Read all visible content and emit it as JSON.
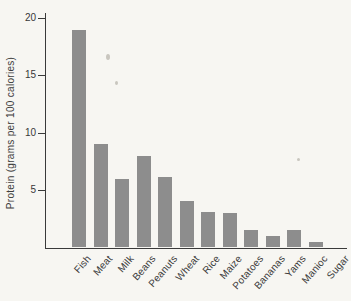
{
  "figure": {
    "background_color": "#f7f6f2",
    "bar_color": "#8d8d8d",
    "axis_color": "#3a3a3a",
    "text_color": "#3a3a3a"
  },
  "chart_data": {
    "type": "bar",
    "title": "",
    "xlabel": "",
    "ylabel": "Protein (grams per 100 calories)",
    "categories": [
      "Fish",
      "Meat",
      "Milk",
      "Beans",
      "Peanuts",
      "Wheat",
      "Rice",
      "Maize",
      "Potatoes",
      "Bananas",
      "Yams",
      "Manioc",
      "Sugar"
    ],
    "values": [
      19,
      9,
      6,
      8,
      6.2,
      4.1,
      3.1,
      3,
      1.5,
      1,
      1.5,
      0.5,
      0
    ],
    "ylim": [
      0,
      20
    ],
    "yticks": [
      5,
      10,
      15,
      20
    ],
    "grid": false,
    "legend": "none",
    "bar_orientation": "vertical",
    "x_tick_rotation_deg": -49
  }
}
